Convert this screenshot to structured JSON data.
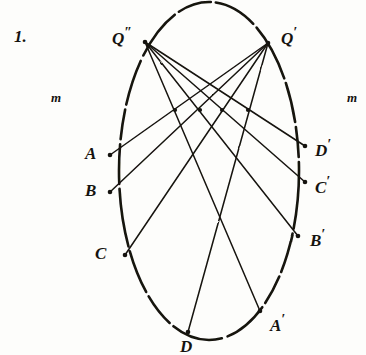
{
  "figure": {
    "number_label": "1.",
    "line_label_left": "m",
    "line_label_right": "m",
    "ink_color": "#15130f",
    "paper_color": "#fdfdfb"
  },
  "geometry": {
    "ellipse": {
      "cx": 209,
      "cy": 171,
      "rx": 90,
      "ry": 169
    },
    "axis_line_m": {
      "y": 110,
      "x_start": 40,
      "x_end": 362
    },
    "axis_intersections_x": [
      175,
      200,
      222,
      248
    ]
  },
  "points": [
    {
      "id": "Q2",
      "label": "Q",
      "prime": "″",
      "x": 145,
      "y": 42,
      "label_x": 112,
      "label_y": 26
    },
    {
      "id": "Q1",
      "label": "Q",
      "prime": "′",
      "x": 268,
      "y": 43,
      "label_x": 281,
      "label_y": 26
    },
    {
      "id": "A",
      "label": "A",
      "prime": "",
      "x": 110,
      "y": 155,
      "label_x": 85,
      "label_y": 145
    },
    {
      "id": "B",
      "label": "B",
      "prime": "",
      "x": 110,
      "y": 192,
      "label_x": 85,
      "label_y": 182
    },
    {
      "id": "C",
      "label": "C",
      "prime": "",
      "x": 125,
      "y": 255,
      "label_x": 95,
      "label_y": 245
    },
    {
      "id": "D",
      "label": "D",
      "prime": "",
      "x": 188,
      "y": 332,
      "label_x": 180,
      "label_y": 338
    },
    {
      "id": "Ap",
      "label": "A",
      "prime": "′",
      "x": 260,
      "y": 311,
      "label_x": 270,
      "label_y": 313
    },
    {
      "id": "Bp",
      "label": "B",
      "prime": "′",
      "x": 298,
      "y": 236,
      "label_x": 310,
      "label_y": 228
    },
    {
      "id": "Cp",
      "label": "C",
      "prime": "′",
      "x": 305,
      "y": 182,
      "label_x": 315,
      "label_y": 175
    },
    {
      "id": "Dp",
      "label": "D",
      "prime": "′",
      "x": 305,
      "y": 146,
      "label_x": 315,
      "label_y": 138
    }
  ],
  "chords": [
    {
      "from": "Q2",
      "to": "Dp"
    },
    {
      "from": "Q2",
      "to": "Cp"
    },
    {
      "from": "Q2",
      "to": "Bp"
    },
    {
      "from": "Q2",
      "to": "Ap"
    },
    {
      "from": "Q1",
      "to": "A"
    },
    {
      "from": "Q1",
      "to": "B"
    },
    {
      "from": "Q1",
      "to": "C"
    },
    {
      "from": "Q1",
      "to": "D"
    }
  ]
}
